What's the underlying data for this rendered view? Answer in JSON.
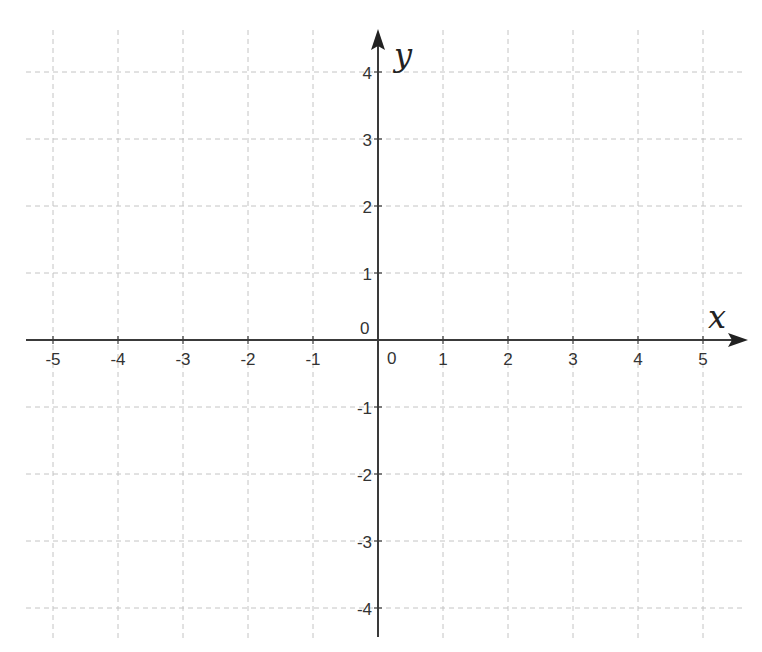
{
  "chart_data": {
    "type": "scatter",
    "title": "",
    "xlabel": "x",
    "ylabel": "y",
    "xlim": [
      -5.5,
      5.5
    ],
    "ylim": [
      -4.5,
      4.5
    ],
    "grid": true,
    "grid_style": "dashed",
    "x_ticks": [
      -5,
      -4,
      -3,
      -2,
      -1,
      0,
      1,
      2,
      3,
      4,
      5
    ],
    "y_ticks": [
      -4,
      -3,
      -2,
      -1,
      0,
      1,
      2,
      3,
      4
    ],
    "x_tick_labels": [
      "-5",
      "-4",
      "-3",
      "-2",
      "-1",
      "0",
      "1",
      "2",
      "3",
      "4",
      "5"
    ],
    "y_tick_labels": [
      "-4",
      "-3",
      "-2",
      "-1",
      "0",
      "1",
      "2",
      "3",
      "4"
    ],
    "series": [],
    "legend": null
  },
  "colors": {
    "axis": "#3a3a3a",
    "grid": "#c4c4c4",
    "label": "#333333",
    "background": "#ffffff"
  },
  "layout": {
    "origin_px": [
      378,
      340
    ],
    "unit_x_px": 65,
    "unit_y_px": 67
  }
}
